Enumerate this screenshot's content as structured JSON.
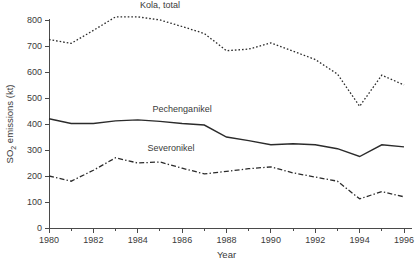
{
  "chart_data": {
    "type": "line",
    "title": "",
    "xlabel": "Year",
    "ylabel": "SO2 emissions (kt)",
    "ylabel_base": "SO",
    "ylabel_sub": "2",
    "ylabel_rest": " emissions (kt)",
    "x": [
      1980,
      1981,
      1982,
      1983,
      1984,
      1985,
      1986,
      1987,
      1988,
      1989,
      1990,
      1991,
      1992,
      1993,
      1994,
      1995,
      1996
    ],
    "xlim": [
      1980,
      1996
    ],
    "ylim": [
      0,
      800
    ],
    "grid": false,
    "legend_position": "inline-labels",
    "xticks": [
      1980,
      1982,
      1984,
      1986,
      1988,
      1990,
      1992,
      1994,
      1996
    ],
    "xtick_labels": [
      "1980",
      "1982",
      "1984",
      "1986",
      "1988",
      "1990",
      "1992",
      "1994",
      "1996"
    ],
    "xminorticks": [
      1981,
      1983,
      1985,
      1987,
      1989,
      1991,
      1993,
      1995
    ],
    "yticks": [
      0,
      100,
      200,
      300,
      400,
      500,
      600,
      700,
      800
    ],
    "ytick_labels": [
      "0",
      "100",
      "200",
      "300",
      "400",
      "500",
      "600",
      "700",
      "800"
    ],
    "series": [
      {
        "name": "Kola, total",
        "style": "dotted",
        "color": "#2b2b2b",
        "label_x": 1985.0,
        "label_y": 845,
        "values": [
          725,
          710,
          760,
          812,
          812,
          800,
          775,
          748,
          682,
          688,
          712,
          680,
          648,
          592,
          468,
          588,
          550
        ]
      },
      {
        "name": "Pechenganikel",
        "style": "solid",
        "color": "#2b2b2b",
        "label_x": 1986.0,
        "label_y": 448,
        "values": [
          420,
          402,
          402,
          412,
          416,
          410,
          402,
          396,
          350,
          336,
          320,
          324,
          320,
          305,
          275,
          320,
          312
        ]
      },
      {
        "name": "Severonikel",
        "style": "dashdot",
        "color": "#2b2b2b",
        "label_x": 1985.5,
        "label_y": 298,
        "values": [
          200,
          180,
          222,
          270,
          250,
          254,
          230,
          208,
          218,
          228,
          235,
          212,
          196,
          180,
          112,
          140,
          120
        ]
      }
    ]
  },
  "plot_geometry": {
    "left": 49,
    "right": 404,
    "top": 20,
    "bottom": 228
  }
}
